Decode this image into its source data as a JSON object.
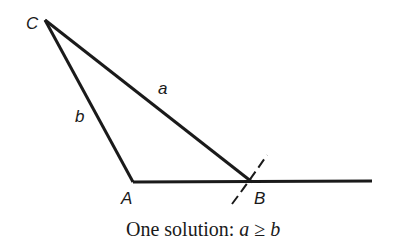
{
  "diagram": {
    "vertices": {
      "C": {
        "label": "C",
        "x": 45,
        "y": 20
      },
      "A": {
        "label": "A",
        "x": 133,
        "y": 182
      },
      "B": {
        "label": "B",
        "x": 252,
        "y": 182
      }
    },
    "sides": {
      "a": {
        "label": "a",
        "from": "C",
        "to": "B"
      },
      "b": {
        "label": "b",
        "from": "C",
        "to": "A"
      }
    },
    "baseline": {
      "from": "A",
      "to_x": 372
    },
    "arc": {
      "description": "dashed arc of radius a centered at C crossing baseline at B"
    },
    "caption": {
      "text": "One solution: ",
      "math_a": "a",
      "math_op": "≥",
      "math_b": "b"
    }
  },
  "colors": {
    "stroke": "#1a1a1a",
    "background": "#ffffff"
  }
}
